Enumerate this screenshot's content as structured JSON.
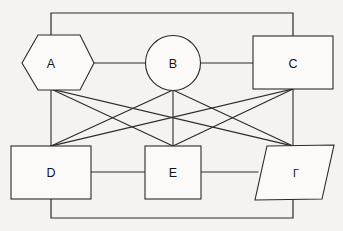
{
  "diagram": {
    "background_color": "#f4f3f1",
    "line_color": "#2a2a2a",
    "node_fill_color": "#fbfaf9",
    "nodes": [
      {
        "id": "A",
        "label": "A",
        "shape": "hexagon",
        "row": "top",
        "cx": 51,
        "cy": 63,
        "width": 86,
        "height": 57
      },
      {
        "id": "B",
        "label": "B",
        "shape": "circle",
        "row": "top",
        "cx": 173,
        "cy": 63,
        "width": 55,
        "height": 55
      },
      {
        "id": "C",
        "label": "C",
        "shape": "rectangle",
        "row": "top",
        "cx": 293,
        "cy": 63,
        "width": 80,
        "height": 53
      },
      {
        "id": "D",
        "label": "D",
        "shape": "rectangle",
        "row": "bottom",
        "cx": 51,
        "cy": 172,
        "width": 80,
        "height": 53
      },
      {
        "id": "E",
        "label": "E",
        "shape": "square",
        "row": "bottom",
        "cx": 173,
        "cy": 172,
        "width": 56,
        "height": 53
      },
      {
        "id": "F",
        "label": "Γ",
        "shape": "parallelogram",
        "row": "bottom",
        "cx": 295,
        "cy": 172,
        "width": 80,
        "height": 53
      }
    ],
    "edges": [
      {
        "from": "A",
        "to": "B",
        "kind": "horizontal"
      },
      {
        "from": "B",
        "to": "C",
        "kind": "horizontal"
      },
      {
        "from": "D",
        "to": "E",
        "kind": "horizontal"
      },
      {
        "from": "E",
        "to": "F",
        "kind": "horizontal"
      },
      {
        "from": "A",
        "to": "D",
        "kind": "vertical"
      },
      {
        "from": "B",
        "to": "E",
        "kind": "vertical"
      },
      {
        "from": "C",
        "to": "F",
        "kind": "vertical"
      },
      {
        "from": "A",
        "to": "E",
        "kind": "diagonal"
      },
      {
        "from": "A",
        "to": "F",
        "kind": "diagonal"
      },
      {
        "from": "B",
        "to": "D",
        "kind": "diagonal"
      },
      {
        "from": "B",
        "to": "F",
        "kind": "diagonal"
      },
      {
        "from": "C",
        "to": "D",
        "kind": "diagonal"
      },
      {
        "from": "C",
        "to": "E",
        "kind": "diagonal"
      },
      {
        "from": "A",
        "to": "C",
        "kind": "perimeter-top"
      },
      {
        "from": "D",
        "to": "F",
        "kind": "perimeter-bottom"
      }
    ]
  }
}
